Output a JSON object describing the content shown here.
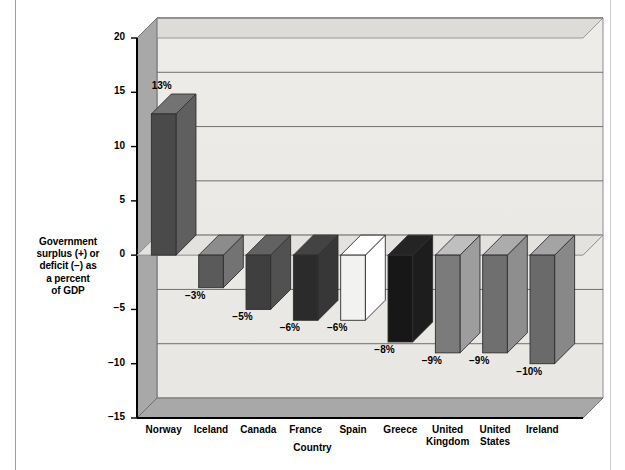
{
  "chart_data": {
    "type": "bar",
    "title": "",
    "subtitle": "",
    "xlabel": "Country",
    "ylabel": "Government surplus (+) or deficit (−) as a percent of GDP",
    "categories": [
      "Norway",
      "Iceland",
      "Canada",
      "France",
      "Spain",
      "Greece",
      "United Kingdom",
      "United States",
      "Ireland"
    ],
    "category_lines": [
      [
        "Norway"
      ],
      [
        "Iceland"
      ],
      [
        "Canada"
      ],
      [
        "France"
      ],
      [
        "Spain"
      ],
      [
        "Greece"
      ],
      [
        "United",
        "Kingdom"
      ],
      [
        "United",
        "States"
      ],
      [
        "Ireland"
      ]
    ],
    "values": [
      13,
      -3,
      -5,
      -6,
      -6,
      -8,
      -9,
      -9,
      -10
    ],
    "data_labels": [
      "13%",
      "−3%",
      "−5%",
      "−6%",
      "−6%",
      "−8%",
      "−9%",
      "−9%",
      "−10%"
    ],
    "bar_colors": [
      "#4a4a4a",
      "#5a5a5a",
      "#3f3f3f",
      "#2b2b2b",
      "#f2f2f0",
      "#171717",
      "#7b7b7b",
      "#6f6f6f",
      "#6a6a6a"
    ],
    "ylim": [
      -15,
      20
    ],
    "yticks": [
      20,
      15,
      10,
      5,
      0,
      -5,
      -10,
      -15
    ],
    "ytick_labels": [
      "20",
      "15",
      "10",
      "5",
      "0",
      "−5",
      "−10",
      "−15"
    ],
    "grid": true,
    "legend": "none",
    "style": "3d-column"
  },
  "colors": {
    "background": "#ffffff",
    "plot_wall": "#eceae6",
    "plot_floor": "#a8a8a8",
    "side_wall": "#a8a8a8",
    "gridline": "#6f6f6f",
    "axis": "#000000",
    "bar_top": "#b5b5b5",
    "bar_side": "#9a9a9a"
  },
  "axis": {
    "y_title_lines": [
      "Government",
      "surplus (+) or",
      "deficit (−) as",
      "a percent",
      "of GDP"
    ],
    "x_title": "Country"
  }
}
